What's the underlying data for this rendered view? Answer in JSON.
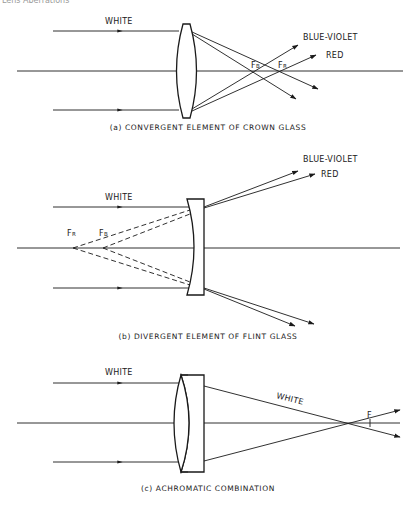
{
  "header": {
    "text": "Lens Aberrations"
  },
  "colors": {
    "ink": "#1a1a1a",
    "background": "#ffffff",
    "header_text": "#9a9a9a"
  },
  "panels": [
    {
      "id": "a",
      "caption": "(a) CONVERGENT ELEMENT OF CROWN GLASS",
      "lens_type": "biconvex",
      "incoming_label": "WHITE",
      "outgoing_labels": {
        "blue": "BLUE-VIOLET",
        "red": "RED"
      },
      "focus_labels": {
        "blue": "F",
        "blue_sub": "B",
        "red": "F",
        "red_sub": "R"
      }
    },
    {
      "id": "b",
      "caption": "(b) DIVERGENT ELEMENT OF FLINT GLASS",
      "lens_type": "plano-concave",
      "incoming_label": "WHITE",
      "outgoing_labels": {
        "blue": "BLUE-VIOLET",
        "red": "RED"
      },
      "focus_labels": {
        "red": "F",
        "red_sub": "R",
        "blue": "F",
        "blue_sub": "B"
      }
    },
    {
      "id": "c",
      "caption": "(c) ACHROMATIC COMBINATION",
      "lens_type": "achromatic doublet",
      "incoming_label": "WHITE",
      "outgoing_label": "WHITE",
      "focus_label": "F"
    }
  ]
}
